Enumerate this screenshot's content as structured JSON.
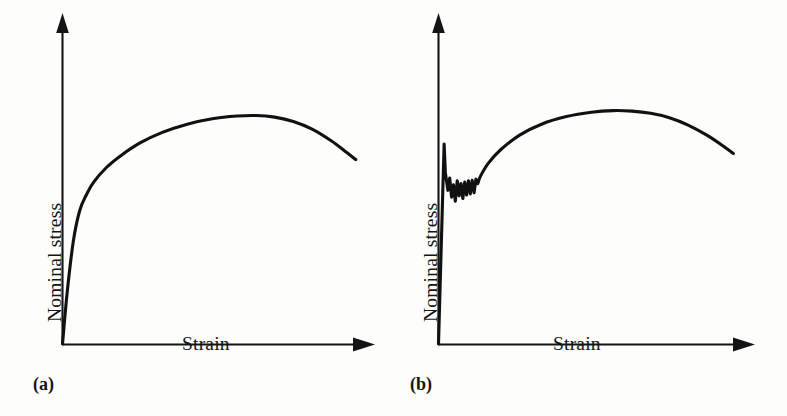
{
  "figure": {
    "background_color": "#fdfdfb",
    "ink_color": "#141414",
    "panels": [
      {
        "id": "a",
        "caption": "(a)",
        "x_axis_label": "Strain",
        "y_axis_label": "Nominal stress"
      },
      {
        "id": "b",
        "caption": "(b)",
        "x_axis_label": "Strain",
        "y_axis_label": "Nominal stress"
      }
    ]
  },
  "chart_data": [
    {
      "type": "line",
      "title": "",
      "subtitle": "",
      "xlabel": "Strain",
      "ylabel": "Nominal stress",
      "panel_label": "(a)",
      "grid": false,
      "legend": false,
      "axis_arrows": true,
      "tick_labels": [],
      "xlim": [
        0,
        1
      ],
      "ylim": [
        0,
        1
      ],
      "description": "Smooth nominal stress-strain curve: steep elastic rise, continuous yielding, work hardening to a maximum, then fall due to necking.",
      "series": [
        {
          "name": "smooth-yielding",
          "x": [
            0.0,
            0.015,
            0.035,
            0.055,
            0.075,
            0.1,
            0.14,
            0.19,
            0.25,
            0.32,
            0.4,
            0.48,
            0.56,
            0.62,
            0.68,
            0.74,
            0.8,
            0.86,
            0.91,
            0.94
          ],
          "y": [
            0.0,
            0.19,
            0.38,
            0.49,
            0.545,
            0.595,
            0.648,
            0.695,
            0.74,
            0.778,
            0.808,
            0.828,
            0.838,
            0.84,
            0.834,
            0.818,
            0.79,
            0.748,
            0.705,
            0.678
          ]
        }
      ]
    },
    {
      "type": "line",
      "title": "",
      "subtitle": "",
      "xlabel": "Strain",
      "ylabel": "Nominal stress",
      "panel_label": "(b)",
      "grid": false,
      "legend": false,
      "axis_arrows": true,
      "tick_labels": [],
      "xlim": [
        0,
        1
      ],
      "ylim": [
        0,
        1
      ],
      "description": "Nominal stress-strain curve showing a sharp upper yield point followed by a serrated (discontinuous) yield plateau, then work hardening to a maximum and fall due to necking.",
      "series": [
        {
          "name": "discontinuous-yielding",
          "x": [
            0.0,
            0.018,
            0.022,
            0.03,
            0.036,
            0.042,
            0.048,
            0.054,
            0.06,
            0.066,
            0.072,
            0.078,
            0.084,
            0.09,
            0.096,
            0.102,
            0.108,
            0.114,
            0.12,
            0.126,
            0.135,
            0.16,
            0.2,
            0.26,
            0.33,
            0.41,
            0.49,
            0.56,
            0.62,
            0.68,
            0.74,
            0.8,
            0.86,
            0.91,
            0.945
          ],
          "y": [
            0.0,
            0.735,
            0.63,
            0.565,
            0.61,
            0.54,
            0.585,
            0.525,
            0.6,
            0.545,
            0.59,
            0.535,
            0.595,
            0.548,
            0.6,
            0.552,
            0.602,
            0.556,
            0.606,
            0.59,
            0.618,
            0.665,
            0.715,
            0.768,
            0.808,
            0.836,
            0.852,
            0.858,
            0.856,
            0.848,
            0.832,
            0.805,
            0.768,
            0.73,
            0.7
          ]
        }
      ]
    }
  ]
}
